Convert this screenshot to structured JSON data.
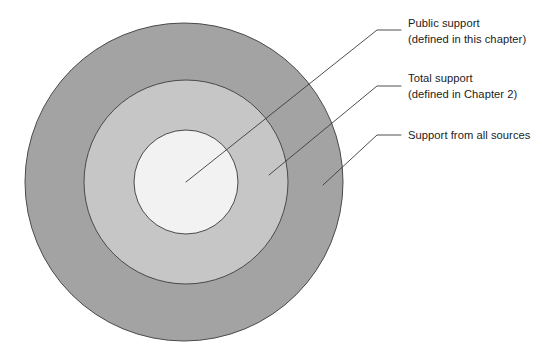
{
  "figure": {
    "background_color": "#ffffff"
  },
  "rings": [
    {
      "id": "outer",
      "name": "Support from all sources",
      "fill": "#a3a3a3",
      "stroke": "#4a4a4a",
      "center_x": 184,
      "center_y": 182,
      "radius": 159
    },
    {
      "id": "middle",
      "name": "Total support",
      "fill": "#c6c6c6",
      "stroke": "#4a4a4a",
      "center_x": 186,
      "center_y": 182,
      "radius": 102
    },
    {
      "id": "inner",
      "name": "Public support",
      "fill": "#f2f2f2",
      "stroke": "#4a4a4a",
      "center_x": 186,
      "center_y": 182,
      "radius": 52
    }
  ],
  "callouts": [
    {
      "id": "public-support",
      "line1": "Public support",
      "line2": "(defined in this chapter)",
      "target_x": 186,
      "target_y": 182,
      "elbow_x": 377,
      "elbow_y": 30,
      "end_x": 401,
      "end_y": 30
    },
    {
      "id": "total-support",
      "line1": "Total support",
      "line2": "(defined in Chapter 2)",
      "target_x": 269,
      "target_y": 175,
      "elbow_x": 377,
      "elbow_y": 86,
      "end_x": 401,
      "end_y": 86
    },
    {
      "id": "support-all-sources",
      "line1": "Support from all sources",
      "line2": "",
      "target_x": 323,
      "target_y": 185,
      "elbow_x": 377,
      "elbow_y": 135,
      "end_x": 401,
      "end_y": 135
    }
  ],
  "colors": {
    "outer_ring": "#a3a3a3",
    "middle_ring": "#c6c6c6",
    "inner_circle": "#f2f2f2",
    "outline": "#4a4a4a",
    "leader_line": "#3b3b3b",
    "text": "#1c1c1c"
  }
}
